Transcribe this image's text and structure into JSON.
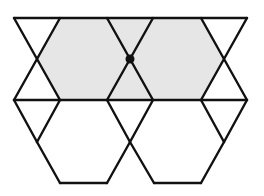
{
  "diagram": {
    "colors": {
      "stroke": "#111111",
      "shade": "#e6e6e6",
      "background": "#ffffff",
      "dot": "#111111"
    },
    "stroke_width": 2.4,
    "shaded_region": [
      [
        60,
        18
      ],
      [
        201,
        18
      ],
      [
        224,
        59
      ],
      [
        201,
        100
      ],
      [
        60,
        100
      ],
      [
        37,
        59
      ]
    ],
    "lines": [
      [
        14,
        18,
        247,
        18
      ],
      [
        14,
        100,
        247,
        100
      ],
      [
        14,
        18,
        60,
        100
      ],
      [
        60,
        18,
        14,
        100
      ],
      [
        107,
        18,
        153,
        100
      ],
      [
        153,
        18,
        107,
        100
      ],
      [
        201,
        18,
        247,
        100
      ],
      [
        247,
        18,
        201,
        100
      ],
      [
        14,
        100,
        37,
        142
      ],
      [
        60,
        100,
        37,
        142
      ],
      [
        107,
        100,
        130,
        142
      ],
      [
        153,
        100,
        130,
        142
      ],
      [
        201,
        100,
        224,
        142
      ],
      [
        247,
        100,
        224,
        142
      ],
      [
        37,
        142,
        60,
        183
      ],
      [
        60,
        183,
        107,
        183
      ],
      [
        107,
        183,
        130,
        142
      ],
      [
        130,
        142,
        154,
        183
      ],
      [
        154,
        183,
        201,
        183
      ],
      [
        201,
        183,
        224,
        142
      ]
    ],
    "marked_point": {
      "x": 130,
      "y": 59,
      "r": 4.5
    }
  }
}
